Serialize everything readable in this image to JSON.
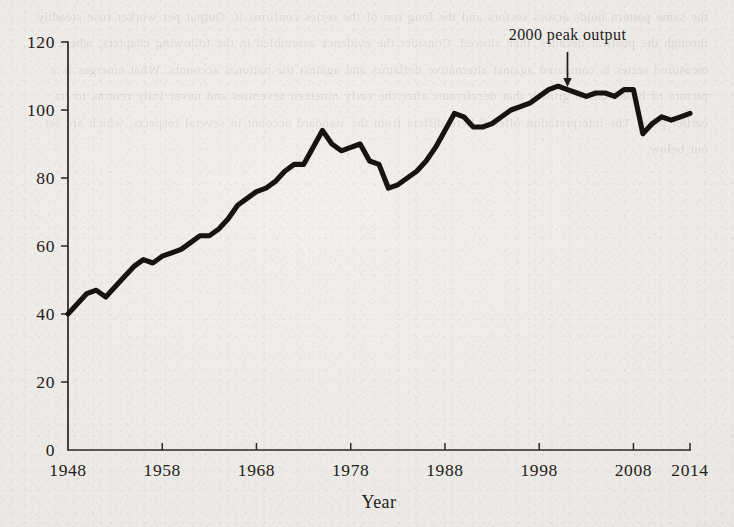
{
  "page": {
    "background_color": "#efedea",
    "ink_color": "#161310",
    "bleed_through_text": "the same pattern holds across sectors and the long run of the series confirms it. Output per worker rose steadily through the postwar decades, then slowed. Consider the evidence assembled in the following chapters, where the measured series is compared against alternative deflators and against the national accounts. What emerges is a picture of broad based growth that decelerates after the early nineteen seventies and never fully returns to its earlier pace. The interpretation offered here differs from the standard account in several respects, which are set out below."
  },
  "chart_data": {
    "type": "line",
    "title": "",
    "xlabel": "Year",
    "ylabel": "",
    "xlim": [
      1948,
      2014
    ],
    "ylim": [
      0,
      120
    ],
    "grid": false,
    "legend": null,
    "xticks": [
      1948,
      1958,
      1968,
      1978,
      1988,
      1998,
      2008,
      2014
    ],
    "xtick_labels": [
      "1948",
      "1958",
      "1968",
      "1978",
      "1988",
      "1998",
      "2008",
      "2014"
    ],
    "yticks": [
      0,
      20,
      40,
      60,
      80,
      100,
      120
    ],
    "ytick_labels": [
      "0",
      "20",
      "40",
      "60",
      "80",
      "100",
      "120"
    ],
    "annotations": [
      {
        "text": "2000 peak output",
        "x": 2001,
        "y": 107,
        "arrow": "down"
      }
    ],
    "x": [
      1948,
      1949,
      1950,
      1951,
      1952,
      1953,
      1954,
      1955,
      1956,
      1957,
      1958,
      1959,
      1960,
      1961,
      1962,
      1963,
      1964,
      1965,
      1966,
      1967,
      1968,
      1969,
      1970,
      1971,
      1972,
      1973,
      1974,
      1975,
      1976,
      1977,
      1978,
      1979,
      1980,
      1981,
      1982,
      1983,
      1984,
      1985,
      1986,
      1987,
      1988,
      1989,
      1990,
      1991,
      1992,
      1993,
      1994,
      1995,
      1996,
      1997,
      1998,
      1999,
      2000,
      2001,
      2002,
      2003,
      2004,
      2005,
      2006,
      2007,
      2008,
      2009,
      2010,
      2011,
      2012,
      2013,
      2014
    ],
    "values": [
      40,
      43,
      46,
      47,
      45,
      48,
      51,
      54,
      56,
      55,
      57,
      58,
      59,
      61,
      63,
      63,
      65,
      68,
      72,
      74,
      76,
      77,
      79,
      82,
      84,
      84,
      89,
      94,
      90,
      88,
      89,
      90,
      85,
      84,
      77,
      78,
      80,
      82,
      85,
      89,
      94,
      99,
      98,
      95,
      95,
      96,
      98,
      100,
      101,
      102,
      104,
      106,
      107,
      106,
      105,
      104,
      105,
      105,
      104,
      106,
      106,
      93,
      96,
      98,
      97,
      98,
      99
    ]
  }
}
